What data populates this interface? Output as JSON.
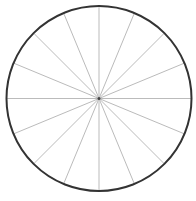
{
  "diagram": {
    "type": "spoked-circle",
    "width": 196,
    "height": 201,
    "center": {
      "x": 99,
      "y": 98.5
    },
    "radius": 92.5,
    "spoke_count": 16,
    "spoke_angle_step_deg": 22.5,
    "colors": {
      "background": "#ffffff",
      "rim": "#333333",
      "spokes": "#bbbbbb",
      "hub": "#444444"
    },
    "rim_width": 2,
    "spoke_width": 1,
    "hub_radius": 1.5
  }
}
